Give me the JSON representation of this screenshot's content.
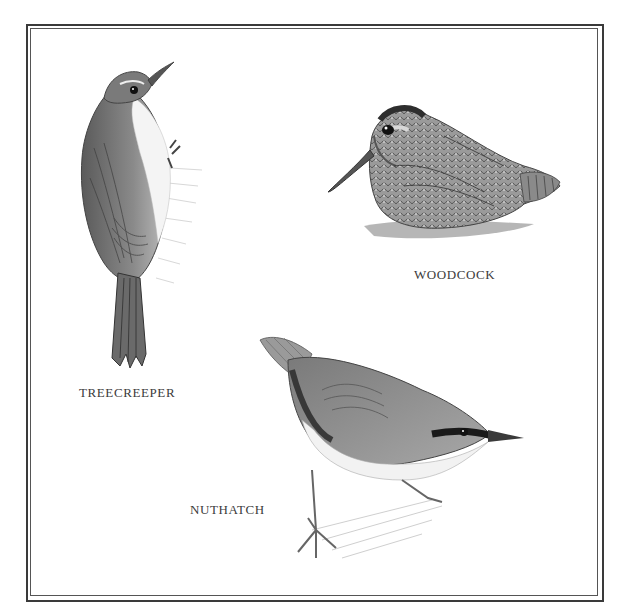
{
  "plate": {
    "border_color": "#3a3a3a",
    "background": "#ffffff"
  },
  "birds": [
    {
      "id": "treecreeper",
      "label": "TREECREEPER"
    },
    {
      "id": "woodcock",
      "label": "WOODCOCK"
    },
    {
      "id": "nuthatch",
      "label": "NUTHATCH"
    }
  ]
}
